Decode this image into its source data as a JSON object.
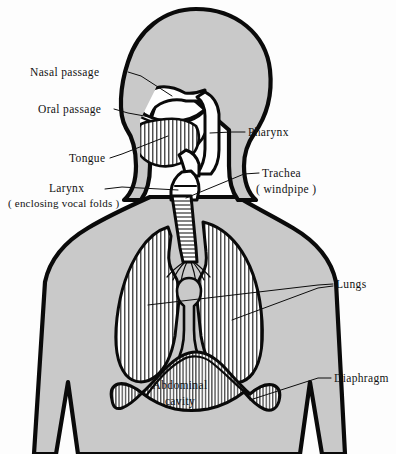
{
  "figure": {
    "background_color": "#fdfdfd",
    "body_fill_color": "#c9c9c9",
    "outline_color": "#0a0a0a",
    "cavity_fill_color": "#ffffff"
  },
  "labels": [
    {
      "id": "nasal-passage",
      "text": "Nasal  passage",
      "lines": [
        "Nasal  passage"
      ],
      "side": "left",
      "x": 30,
      "y": 76,
      "anchor": "start"
    },
    {
      "id": "oral-passage",
      "text": "Oral  passage",
      "lines": [
        "Oral  passage"
      ],
      "side": "left",
      "x": 38,
      "y": 113,
      "anchor": "start"
    },
    {
      "id": "tongue",
      "text": "Tongue",
      "lines": [
        "Tongue"
      ],
      "side": "left",
      "x": 69,
      "y": 162,
      "anchor": "start"
    },
    {
      "id": "larynx",
      "text": "Larynx",
      "lines": [
        "Larynx",
        "( enclosing  vocal  folds )"
      ],
      "side": "left",
      "x": 49,
      "y": 192,
      "anchor": "start"
    },
    {
      "id": "larynx-sub",
      "text": "( enclosing  vocal  folds )",
      "lines": [
        "( enclosing  vocal  folds )"
      ],
      "side": "left",
      "x": 8,
      "y": 206,
      "anchor": "start"
    },
    {
      "id": "pharynx",
      "text": "Pharynx",
      "lines": [
        "Pharynx"
      ],
      "side": "right",
      "x": 248,
      "y": 136,
      "anchor": "start"
    },
    {
      "id": "trachea",
      "text": "Trachea",
      "lines": [
        "Trachea",
        "( windpipe )"
      ],
      "side": "right",
      "x": 262,
      "y": 177,
      "anchor": "start"
    },
    {
      "id": "trachea-sub",
      "text": "( windpipe )",
      "lines": [
        "( windpipe )"
      ],
      "side": "right",
      "x": 255,
      "y": 192,
      "anchor": "start"
    },
    {
      "id": "lungs",
      "text": "Lungs",
      "lines": [
        "Lungs"
      ],
      "side": "right",
      "x": 336,
      "y": 287,
      "anchor": "start"
    },
    {
      "id": "diaphragm",
      "text": "Diaphragm",
      "lines": [
        "Diaphragm"
      ],
      "side": "right",
      "x": 334,
      "y": 381,
      "anchor": "start"
    },
    {
      "id": "abdominal-cavity",
      "text": "Abdominal cavity",
      "lines": [
        "Abdominal",
        "cavity"
      ],
      "side": "center",
      "x": 180,
      "y": 388,
      "anchor": "middle"
    },
    {
      "id": "abdominal-cavity-line2",
      "text": "cavity",
      "lines": [
        "cavity"
      ],
      "side": "center",
      "x": 180,
      "y": 404,
      "anchor": "middle"
    }
  ],
  "structures": [
    {
      "id": "head",
      "name": "head"
    },
    {
      "id": "neck",
      "name": "neck"
    },
    {
      "id": "torso",
      "name": "torso"
    },
    {
      "id": "left-arm",
      "name": "left-arm"
    },
    {
      "id": "right-arm",
      "name": "right-arm"
    },
    {
      "id": "nasal-cavity",
      "name": "nasal-cavity"
    },
    {
      "id": "oral-cavity",
      "name": "oral-cavity"
    },
    {
      "id": "tongue-organ",
      "name": "tongue"
    },
    {
      "id": "pharynx-channel",
      "name": "pharynx"
    },
    {
      "id": "larynx-organ",
      "name": "larynx"
    },
    {
      "id": "trachea-tube",
      "name": "trachea"
    },
    {
      "id": "bronchi",
      "name": "bronchi"
    },
    {
      "id": "lung-left",
      "name": "left-lung"
    },
    {
      "id": "lung-right",
      "name": "right-lung"
    },
    {
      "id": "heart-mediastinum",
      "name": "mediastinum"
    },
    {
      "id": "diaphragm-dome",
      "name": "diaphragm"
    }
  ]
}
